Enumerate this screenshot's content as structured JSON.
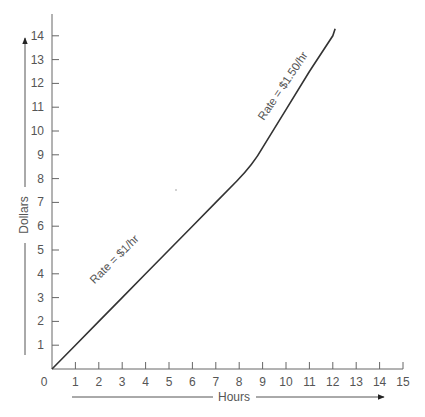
{
  "chart_data": {
    "type": "line",
    "title": "",
    "xlabel": "Hours",
    "ylabel": "Dollars",
    "xlim": [
      0,
      15
    ],
    "ylim": [
      0,
      14
    ],
    "x_ticks": [
      "0",
      "1",
      "2",
      "3",
      "4",
      "5",
      "6",
      "7",
      "8",
      "9",
      "10",
      "11",
      "12",
      "13",
      "14",
      "15"
    ],
    "y_ticks": [
      "1",
      "2",
      "3",
      "4",
      "5",
      "6",
      "7",
      "8",
      "9",
      "10",
      "11",
      "12",
      "13",
      "14"
    ],
    "grid": false,
    "legend": null,
    "series": [
      {
        "name": "Earnings",
        "x": [
          0,
          1,
          2,
          3,
          4,
          5,
          6,
          7,
          8,
          9,
          10,
          11,
          12,
          12.1
        ],
        "y": [
          0,
          1,
          2,
          3,
          4,
          5,
          6,
          7,
          8,
          9.3,
          10.9,
          12.5,
          14.0,
          14.3
        ]
      }
    ],
    "annotations": [
      {
        "text": "Rate = $1/hr",
        "x": 3.5,
        "y": 3.9,
        "rotation": -45
      },
      {
        "text": "Rate = $1.50/hr",
        "x": 10.5,
        "y": 11.6,
        "rotation": -56
      }
    ]
  },
  "labels": {
    "origin": "0",
    "xlabel": "Hours",
    "ylabel": "Dollars",
    "rate1": "Rate = $1/hr",
    "rate2": "Rate = $1.50/hr"
  },
  "colors": {
    "line": "#333333",
    "axis": "#555555",
    "text": "#555555"
  }
}
